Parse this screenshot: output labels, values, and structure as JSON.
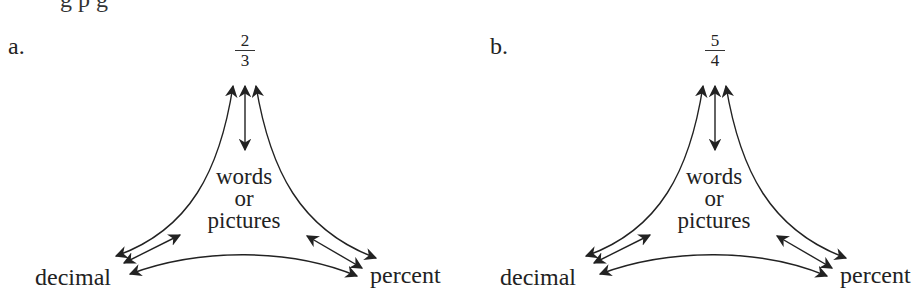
{
  "header_fragment": "g p g",
  "panels": [
    {
      "label": "a.",
      "fraction": {
        "numerator": "2",
        "denominator": "3"
      },
      "center_text": [
        "words",
        "or",
        "pictures"
      ],
      "left_node": "decimal",
      "right_node": "percent"
    },
    {
      "label": "b.",
      "fraction": {
        "numerator": "5",
        "denominator": "4"
      },
      "center_text": [
        "words",
        "or",
        "pictures"
      ],
      "left_node": "decimal",
      "right_node": "percent"
    }
  ],
  "colors": {
    "ink": "#222222",
    "background": "#ffffff"
  }
}
